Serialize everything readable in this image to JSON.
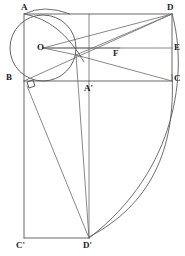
{
  "figure": {
    "width": 185,
    "height": 256,
    "background_color": "#ffffff",
    "line_color": "#58585c",
    "label_color": "#1d1d20"
  },
  "points": [
    {
      "id": "A",
      "label": "A",
      "x": 24,
      "y": 14,
      "label_x": 21,
      "label_y": 3
    },
    {
      "id": "D",
      "label": "D",
      "x": 172,
      "y": 14,
      "label_x": 167,
      "label_y": 3
    },
    {
      "id": "O",
      "label": "O",
      "x": 43,
      "y": 48,
      "label_x": 37,
      "label_y": 43
    },
    {
      "id": "F",
      "label": "F",
      "x": 120,
      "y": 48,
      "label_x": 113,
      "label_y": 49
    },
    {
      "id": "E",
      "label": "E",
      "x": 172,
      "y": 48,
      "label_x": 174,
      "label_y": 43
    },
    {
      "id": "B",
      "label": "B",
      "x": 24,
      "y": 81,
      "label_x": 6,
      "label_y": 73
    },
    {
      "id": "Ap",
      "label": "A'",
      "x": 89,
      "y": 81,
      "label_x": 84,
      "label_y": 84
    },
    {
      "id": "C",
      "label": "C",
      "x": 172,
      "y": 81,
      "label_x": 174,
      "label_y": 74
    },
    {
      "id": "Cp",
      "label": "C'",
      "x": 24,
      "y": 238,
      "label_x": 16,
      "label_y": 241
    },
    {
      "id": "Dp",
      "label": "D'",
      "x": 89,
      "y": 238,
      "label_x": 83,
      "label_y": 241
    }
  ],
  "circle": {
    "name": "inscribed-circle",
    "center_x": 43,
    "center_y": 48,
    "radius": 33
  },
  "segments": [
    {
      "name": "top-edge-AD",
      "from": "A",
      "to": "D"
    },
    {
      "name": "left-edge-AB",
      "from": "A",
      "to": "B"
    },
    {
      "name": "right-edge-DC",
      "from": "D",
      "to": "C"
    },
    {
      "name": "mid-horizontal-OE",
      "from": "O",
      "to": "E"
    },
    {
      "name": "base-line-BC",
      "from": "B",
      "to": "C"
    },
    {
      "name": "vertical-median",
      "from": "Ap",
      "to": "Dp"
    },
    {
      "name": "left-edge-BCp",
      "from": "B",
      "to": "Cp"
    },
    {
      "name": "bottom-edge-CpDp",
      "from": "Cp",
      "to": "Dp"
    },
    {
      "name": "diagonal-B-D",
      "from": "B",
      "to": "D"
    },
    {
      "name": "diagonal-O-D",
      "from": "O",
      "to": "D"
    },
    {
      "name": "ray-O-F",
      "from": "O",
      "to": "F"
    },
    {
      "name": "chord-D-P",
      "from": "D",
      "to": "P"
    },
    {
      "name": "segment-P-C",
      "from": "P",
      "to": "C"
    },
    {
      "name": "segment-B-Dp",
      "from": "B",
      "to": "Dp"
    },
    {
      "name": "segment-P-Dp",
      "from": "P",
      "to": "Dp"
    }
  ],
  "arcs": [
    {
      "name": "outer-arc-D-to-Dp",
      "description": "large arc from D sweeping right then down to D'"
    },
    {
      "name": "inner-arc-C-to-Dp",
      "description": "inner arc from near C down to D'"
    },
    {
      "name": "upper-small-arc",
      "description": "short arc crossing top-left region near A"
    }
  ],
  "marks": [
    {
      "name": "right-angle-at-B",
      "at": "B",
      "description": "small square indicating perpendicularity"
    }
  ]
}
